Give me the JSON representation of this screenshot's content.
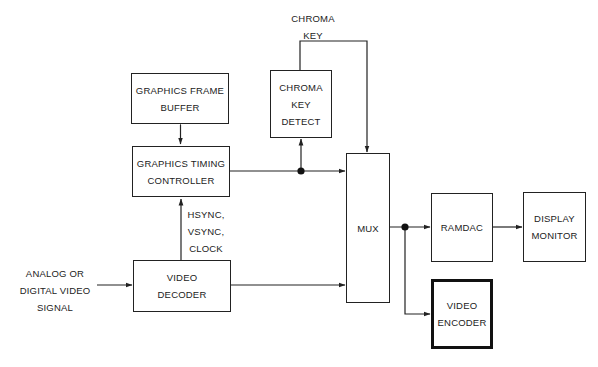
{
  "diagram": {
    "type": "block-diagram",
    "title": "",
    "blocks": {
      "graphics_frame_buffer": {
        "lines": [
          "GRAPHICS FRAME",
          "BUFFER"
        ]
      },
      "graphics_timing_controller": {
        "lines": [
          "GRAPHICS TIMING",
          "CONTROLLER"
        ]
      },
      "chroma_key_detect": {
        "lines": [
          "CHROMA",
          "KEY",
          "DETECT"
        ]
      },
      "video_decoder": {
        "lines": [
          "VIDEO",
          "DECODER"
        ]
      },
      "mux": {
        "lines": [
          "MUX"
        ]
      },
      "ramdac": {
        "lines": [
          "RAMDAC"
        ]
      },
      "display_monitor": {
        "lines": [
          "DISPLAY",
          "MONITOR"
        ]
      },
      "video_encoder": {
        "lines": [
          "VIDEO",
          "ENCODER"
        ]
      }
    },
    "labels": {
      "chroma_key": [
        "CHROMA",
        "KEY"
      ],
      "sync_signals": [
        "HSYNC,",
        "VSYNC,",
        "CLOCK"
      ],
      "input_signal": [
        "ANALOG OR",
        "DIGITAL VIDEO",
        "SIGNAL"
      ]
    },
    "connections": [
      {
        "from": "graphics_frame_buffer",
        "to": "graphics_timing_controller",
        "bidirectional": true
      },
      {
        "from": "video_decoder",
        "to": "graphics_timing_controller",
        "label": "HSYNC, VSYNC, CLOCK"
      },
      {
        "from": "input_signal",
        "to": "video_decoder"
      },
      {
        "from": "graphics_timing_controller",
        "to": "mux",
        "junction": true
      },
      {
        "from": "graphics_timing_controller",
        "to": "chroma_key_detect"
      },
      {
        "from": "chroma_key_detect",
        "to": "mux",
        "label": "CHROMA KEY"
      },
      {
        "from": "video_decoder",
        "to": "mux"
      },
      {
        "from": "mux",
        "to": "ramdac",
        "junction": true
      },
      {
        "from": "mux",
        "to": "video_encoder"
      },
      {
        "from": "ramdac",
        "to": "display_monitor"
      }
    ],
    "colors": {
      "line": "#222222",
      "background": "#ffffff"
    }
  }
}
